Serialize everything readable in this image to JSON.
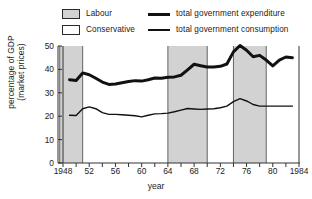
{
  "chart_data": {
    "type": "line",
    "title": "",
    "xlabel": "year",
    "ylabel": "percentage of GDP (market prices)",
    "ylabel_line1": "percentage of GDP",
    "ylabel_line2": "(market prices)",
    "xlim": [
      1948,
      1984
    ],
    "ylim": [
      0,
      50
    ],
    "grid": false,
    "legend_position": "top",
    "yticks": [
      0,
      10,
      20,
      30,
      40,
      50
    ],
    "ytick_labels": [
      "0",
      "10",
      "20",
      "30",
      "40",
      "50"
    ],
    "xticks": [
      1948,
      1952,
      1956,
      1960,
      1964,
      1968,
      1972,
      1976,
      1980,
      1984
    ],
    "xtick_labels": [
      "1948",
      "52",
      "56",
      "60",
      "64",
      "68",
      "72",
      "76",
      "80",
      "1984"
    ],
    "xtick_minor": [
      1950,
      1954,
      1958,
      1962,
      1966,
      1970,
      1974,
      1978,
      1982
    ],
    "legend": [
      {
        "key": "labour-swatch",
        "label": "Labour",
        "type": "band",
        "color": "#d2d2d2"
      },
      {
        "key": "conservative-swatch",
        "label": "Conservative",
        "type": "band",
        "color": "#ffffff"
      },
      {
        "key": "expenditure-line",
        "label": "total government expenditure",
        "type": "line",
        "color": "#111111",
        "width": 3
      },
      {
        "key": "consumption-line",
        "label": "total government consumption",
        "type": "line",
        "color": "#111111",
        "width": 1.4
      }
    ],
    "shaded_bands": [
      {
        "party": "Labour",
        "start": 1947.5,
        "end": 1951.0,
        "color": "#d2d2d2"
      },
      {
        "party": "Labour",
        "start": 1964.0,
        "end": 1970.0,
        "color": "#d2d2d2"
      },
      {
        "party": "Labour",
        "start": 1974.0,
        "end": 1979.0,
        "color": "#d2d2d2"
      }
    ],
    "series": [
      {
        "name": "total government expenditure",
        "color": "#111111",
        "width": 3,
        "x": [
          1949,
          1950,
          1951,
          1952,
          1953,
          1954,
          1955,
          1956,
          1957,
          1958,
          1959,
          1960,
          1961,
          1962,
          1963,
          1964,
          1965,
          1966,
          1967,
          1968,
          1969,
          1970,
          1971,
          1972,
          1973,
          1974,
          1975,
          1976,
          1977,
          1978,
          1979,
          1980,
          1981,
          1982,
          1983
        ],
        "values": [
          35.6,
          35.3,
          38.5,
          37.7,
          36.2,
          34.6,
          33.6,
          33.8,
          34.3,
          34.8,
          35.2,
          35.0,
          35.6,
          36.3,
          36.2,
          36.6,
          36.8,
          37.5,
          39.8,
          42.2,
          41.6,
          41.0,
          41.0,
          41.3,
          42.3,
          47.5,
          50.2,
          48.2,
          45.4,
          46.0,
          44.0,
          41.5,
          44.0,
          45.3,
          45.0
        ]
      },
      {
        "name": "total government consumption",
        "color": "#111111",
        "width": 1.4,
        "x": [
          1949,
          1950,
          1951,
          1952,
          1953,
          1954,
          1955,
          1956,
          1957,
          1958,
          1959,
          1960,
          1961,
          1962,
          1963,
          1964,
          1965,
          1966,
          1967,
          1968,
          1969,
          1970,
          1971,
          1972,
          1973,
          1974,
          1975,
          1976,
          1977,
          1978,
          1979,
          1980,
          1981,
          1982,
          1983
        ],
        "values": [
          20.4,
          20.3,
          23.2,
          24.0,
          23.2,
          21.5,
          20.8,
          20.8,
          20.6,
          20.4,
          20.2,
          19.7,
          20.4,
          21.0,
          21.1,
          21.3,
          21.9,
          22.6,
          23.3,
          23.1,
          22.9,
          23.1,
          23.2,
          23.6,
          24.3,
          26.2,
          27.5,
          26.5,
          25.0,
          24.3,
          24.3,
          24.3,
          24.3,
          24.3,
          24.3
        ]
      }
    ]
  }
}
